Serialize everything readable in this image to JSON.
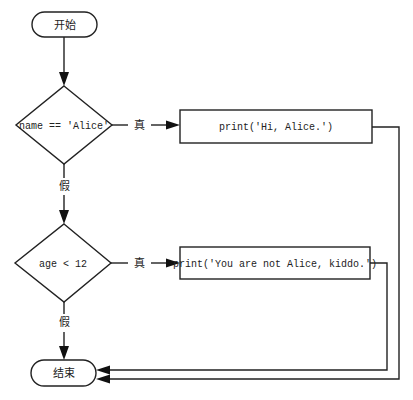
{
  "diagram": {
    "type": "flowchart",
    "nodes": {
      "start": {
        "label": "开始",
        "shape": "terminator"
      },
      "cond1": {
        "label": "name == 'Alice'",
        "shape": "decision"
      },
      "action1": {
        "label": "print('Hi, Alice.')",
        "shape": "process"
      },
      "cond2": {
        "label": "age < 12",
        "shape": "decision"
      },
      "action2": {
        "label": "print('You are not Alice, kiddo.')",
        "shape": "process"
      },
      "end": {
        "label": "结束",
        "shape": "terminator"
      }
    },
    "edges": {
      "cond1_true": {
        "from": "cond1",
        "to": "action1",
        "label": "真"
      },
      "cond1_false": {
        "from": "cond1",
        "to": "cond2",
        "label": "假"
      },
      "cond2_true": {
        "from": "cond2",
        "to": "action2",
        "label": "真"
      },
      "cond2_false": {
        "from": "cond2",
        "to": "end",
        "label": "假"
      },
      "start_to_cond1": {
        "from": "start",
        "to": "cond1",
        "label": ""
      },
      "action1_to_end": {
        "from": "action1",
        "to": "end",
        "label": ""
      },
      "action2_to_end": {
        "from": "action2",
        "to": "end",
        "label": ""
      }
    }
  }
}
